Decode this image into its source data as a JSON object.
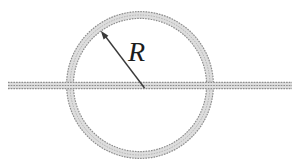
{
  "figure": {
    "type": "physics-diagram",
    "radius_label": "R",
    "colors": {
      "background": "#ffffff",
      "tube_fill": "#dddddd",
      "tube_edge": "#8d8d8d",
      "tube_mid": "#aaaaaa",
      "arrow": "#3a3a3a",
      "label": "#1c1c1c"
    }
  }
}
